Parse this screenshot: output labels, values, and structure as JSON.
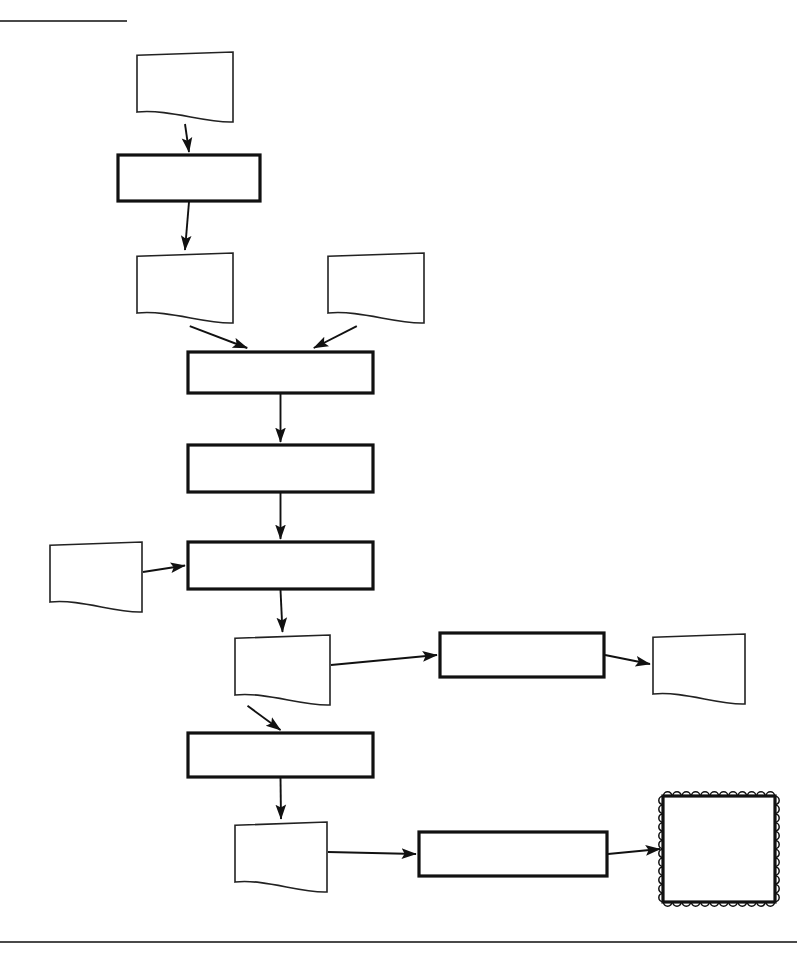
{
  "page": {
    "top_rule": {
      "visible": true,
      "x1": 0,
      "y1": 21,
      "x2": 127,
      "y2": 21
    },
    "bottom_rule": {
      "visible": true,
      "x1": 0,
      "y1": 942,
      "x2": 797,
      "y2": 942
    },
    "background_color": "#ffffff",
    "line_color": "#111111"
  },
  "diagram": {
    "type": "flowchart",
    "orientation": "top-to-bottom",
    "nodes": [
      {
        "id": "gsm",
        "label": ".gsm",
        "shape": "document",
        "x": 137,
        "y": 52,
        "w": 96,
        "h": 60
      },
      {
        "id": "assembler",
        "label": "Assembler",
        "shape": "process",
        "x": 118,
        "y": 155,
        "w": 142,
        "h": 46
      },
      {
        "id": "dat",
        "label": ".dat",
        "shape": "document",
        "x": 137,
        "y": 253,
        "w": 96,
        "h": 60
      },
      {
        "id": "vhd",
        "label": ".vhd",
        "shape": "document",
        "x": 328,
        "y": 253,
        "w": 96,
        "h": 60
      },
      {
        "id": "synthesis",
        "label": "Synthesis",
        "shape": "process",
        "x": 188,
        "y": 352,
        "w": 185,
        "h": 41
      },
      {
        "id": "mapping",
        "label": "Mapping",
        "shape": "process",
        "x": 188,
        "y": 445,
        "w": 185,
        "h": 47
      },
      {
        "id": "pcf",
        "label": ".pcf",
        "shape": "document",
        "x": 50,
        "y": 542,
        "w": 92,
        "h": 60
      },
      {
        "id": "par",
        "label": "Place & Route",
        "shape": "process",
        "x": 188,
        "y": 542,
        "w": 185,
        "h": 47
      },
      {
        "id": "ncd",
        "label": ".ncd",
        "shape": "document",
        "x": 235,
        "y": 635,
        "w": 95,
        "h": 60
      },
      {
        "id": "static",
        "label": "Static Timing",
        "shape": "process",
        "x": 440,
        "y": 633,
        "w": 164,
        "h": 44
      },
      {
        "id": "report",
        "label": "Report",
        "shape": "document",
        "x": 653,
        "y": 634,
        "w": 92,
        "h": 60
      },
      {
        "id": "genbit",
        "label": "Gen Bit File",
        "shape": "process",
        "x": 188,
        "y": 733,
        "w": 185,
        "h": 44
      },
      {
        "id": "bit",
        "label": ".bit",
        "shape": "document",
        "x": 235,
        "y": 822,
        "w": 92,
        "h": 60
      },
      {
        "id": "prog",
        "label": "Programmer",
        "shape": "process",
        "x": 419,
        "y": 832,
        "w": 188,
        "h": 44
      },
      {
        "id": "fpga",
        "label": "FPGA",
        "shape": "chip",
        "x": 663,
        "y": 796,
        "w": 112,
        "h": 106
      }
    ],
    "edges": [
      {
        "from": "gsm",
        "to": "assembler",
        "kind": "vertical"
      },
      {
        "from": "assembler",
        "to": "dat",
        "kind": "vertical"
      },
      {
        "from": "dat",
        "to": "synthesis",
        "kind": "diagonal"
      },
      {
        "from": "vhd",
        "to": "synthesis",
        "kind": "diagonal"
      },
      {
        "from": "synthesis",
        "to": "mapping",
        "kind": "vertical"
      },
      {
        "from": "mapping",
        "to": "par",
        "kind": "vertical"
      },
      {
        "from": "pcf",
        "to": "par",
        "kind": "horizontal"
      },
      {
        "from": "par",
        "to": "ncd",
        "kind": "vertical"
      },
      {
        "from": "ncd",
        "to": "static",
        "kind": "horizontal"
      },
      {
        "from": "static",
        "to": "report",
        "kind": "horizontal"
      },
      {
        "from": "ncd",
        "to": "genbit",
        "kind": "vertical"
      },
      {
        "from": "genbit",
        "to": "bit",
        "kind": "vertical"
      },
      {
        "from": "bit",
        "to": "prog",
        "kind": "horizontal"
      },
      {
        "from": "prog",
        "to": "fpga",
        "kind": "horizontal"
      }
    ]
  }
}
